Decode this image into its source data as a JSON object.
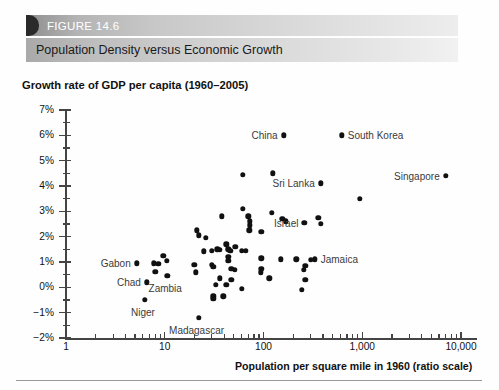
{
  "figure": {
    "tab_label": "FIGURE 14.6",
    "title": "Population Density versus Economic Growth"
  },
  "chart_data": {
    "type": "scatter",
    "title": "Population Density versus Economic Growth",
    "ylabel": "Growth rate of GDP per capita (1960–2005)",
    "xlabel": "Population per square mile in 1960 (ratio scale)",
    "xscale": "log",
    "xlim": [
      1,
      10000
    ],
    "ylim": [
      -2,
      7
    ],
    "grid": false,
    "legend": "none",
    "x_ticks": [
      "1",
      "10",
      "100",
      "1,000",
      "10,000"
    ],
    "x_tick_values": [
      1,
      10,
      100,
      1000,
      10000
    ],
    "y_ticks": [
      "7%",
      "6%",
      "5%",
      "4%",
      "3%",
      "2%",
      "1%",
      "0%",
      "−1%",
      "−2%"
    ],
    "y_tick_values": [
      7,
      6,
      5,
      4,
      3,
      2,
      1,
      0,
      -1,
      -2
    ],
    "annotations": [
      {
        "label": "China",
        "x": 160,
        "y": 6.0,
        "side": "left"
      },
      {
        "label": "South Korea",
        "x": 620,
        "y": 6.0,
        "side": "right"
      },
      {
        "label": "Singapore",
        "x": 7000,
        "y": 4.4,
        "side": "left"
      },
      {
        "label": "Sri Lanka",
        "x": 380,
        "y": 4.1,
        "side": "left"
      },
      {
        "label": "Israel",
        "x": 260,
        "y": 2.55,
        "side": "left"
      },
      {
        "label": "Jamaica",
        "x": 330,
        "y": 1.1,
        "side": "right"
      },
      {
        "label": "Gabon",
        "x": 5.2,
        "y": 0.95,
        "side": "left"
      },
      {
        "label": "Chad",
        "x": 6.6,
        "y": 0.2,
        "side": "left"
      },
      {
        "label": "Zambia",
        "x": 10.6,
        "y": 0.45,
        "side": "below"
      },
      {
        "label": "Niger",
        "x": 6.3,
        "y": -0.5,
        "side": "below"
      },
      {
        "label": "Madagascar",
        "x": 22,
        "y": -1.2,
        "side": "below"
      }
    ],
    "points": [
      {
        "x": 160,
        "y": 6.0,
        "label": "China"
      },
      {
        "x": 620,
        "y": 6.0,
        "label": "South Korea"
      },
      {
        "x": 7000,
        "y": 4.4,
        "label": "Singapore"
      },
      {
        "x": 380,
        "y": 4.1,
        "label": "Sri Lanka"
      },
      {
        "x": 260,
        "y": 2.55,
        "label": "Israel"
      },
      {
        "x": 330,
        "y": 1.1,
        "label": "Jamaica"
      },
      {
        "x": 5.2,
        "y": 0.95,
        "label": "Gabon"
      },
      {
        "x": 6.6,
        "y": 0.2,
        "label": "Chad"
      },
      {
        "x": 10.6,
        "y": 0.45,
        "label": "Zambia"
      },
      {
        "x": 6.3,
        "y": -0.5,
        "label": "Niger"
      },
      {
        "x": 22,
        "y": -1.2,
        "label": "Madagascar"
      },
      {
        "x": 62,
        "y": 4.45,
        "label": ""
      },
      {
        "x": 125,
        "y": 4.5,
        "label": ""
      },
      {
        "x": 950,
        "y": 3.5,
        "label": ""
      },
      {
        "x": 62,
        "y": 3.1,
        "label": ""
      },
      {
        "x": 122,
        "y": 2.95,
        "label": ""
      },
      {
        "x": 38,
        "y": 2.8,
        "label": ""
      },
      {
        "x": 70,
        "y": 2.8,
        "label": ""
      },
      {
        "x": 73,
        "y": 2.6,
        "label": ""
      },
      {
        "x": 73,
        "y": 2.45,
        "label": ""
      },
      {
        "x": 155,
        "y": 2.7,
        "label": ""
      },
      {
        "x": 168,
        "y": 2.6,
        "label": ""
      },
      {
        "x": 360,
        "y": 2.75,
        "label": ""
      },
      {
        "x": 380,
        "y": 2.5,
        "label": ""
      },
      {
        "x": 72,
        "y": 2.25,
        "label": ""
      },
      {
        "x": 21,
        "y": 2.25,
        "label": ""
      },
      {
        "x": 22,
        "y": 2.05,
        "label": ""
      },
      {
        "x": 95,
        "y": 2.2,
        "label": ""
      },
      {
        "x": 26,
        "y": 1.95,
        "label": ""
      },
      {
        "x": 42,
        "y": 1.7,
        "label": ""
      },
      {
        "x": 52,
        "y": 1.6,
        "label": ""
      },
      {
        "x": 30,
        "y": 1.45,
        "label": ""
      },
      {
        "x": 34,
        "y": 1.5,
        "label": ""
      },
      {
        "x": 36,
        "y": 1.48,
        "label": ""
      },
      {
        "x": 44,
        "y": 1.5,
        "label": ""
      },
      {
        "x": 46,
        "y": 1.45,
        "label": ""
      },
      {
        "x": 60,
        "y": 1.45,
        "label": ""
      },
      {
        "x": 66,
        "y": 1.45,
        "label": ""
      },
      {
        "x": 25,
        "y": 1.42,
        "label": ""
      },
      {
        "x": 9.7,
        "y": 1.25,
        "label": ""
      },
      {
        "x": 10.5,
        "y": 1.05,
        "label": ""
      },
      {
        "x": 44,
        "y": 1.2,
        "label": ""
      },
      {
        "x": 44,
        "y": 1.05,
        "label": ""
      },
      {
        "x": 95,
        "y": 1.15,
        "label": ""
      },
      {
        "x": 150,
        "y": 1.1,
        "label": ""
      },
      {
        "x": 215,
        "y": 1.1,
        "label": ""
      },
      {
        "x": 265,
        "y": 0.85,
        "label": ""
      },
      {
        "x": 7.7,
        "y": 0.95,
        "label": ""
      },
      {
        "x": 8.6,
        "y": 0.92,
        "label": ""
      },
      {
        "x": 20,
        "y": 0.9,
        "label": ""
      },
      {
        "x": 30,
        "y": 0.9,
        "label": ""
      },
      {
        "x": 31,
        "y": 0.8,
        "label": ""
      },
      {
        "x": 8.0,
        "y": 0.62,
        "label": ""
      },
      {
        "x": 20.5,
        "y": 0.6,
        "label": ""
      },
      {
        "x": 47,
        "y": 0.72,
        "label": ""
      },
      {
        "x": 51,
        "y": 0.7,
        "label": ""
      },
      {
        "x": 95,
        "y": 0.72,
        "label": ""
      },
      {
        "x": 94,
        "y": 0.6,
        "label": ""
      },
      {
        "x": 255,
        "y": 0.7,
        "label": ""
      },
      {
        "x": 300,
        "y": 1.08,
        "label": ""
      },
      {
        "x": 36,
        "y": 0.35,
        "label": ""
      },
      {
        "x": 47,
        "y": 0.3,
        "label": ""
      },
      {
        "x": 115,
        "y": 0.35,
        "label": ""
      },
      {
        "x": 265,
        "y": 0.3,
        "label": ""
      },
      {
        "x": 33,
        "y": 0.1,
        "label": ""
      },
      {
        "x": 42,
        "y": 0.1,
        "label": ""
      },
      {
        "x": 60,
        "y": -0.05,
        "label": ""
      },
      {
        "x": 245,
        "y": -0.1,
        "label": ""
      },
      {
        "x": 31,
        "y": -0.35,
        "label": ""
      },
      {
        "x": 31,
        "y": -0.45,
        "label": ""
      },
      {
        "x": 39,
        "y": -0.35,
        "label": ""
      }
    ]
  }
}
